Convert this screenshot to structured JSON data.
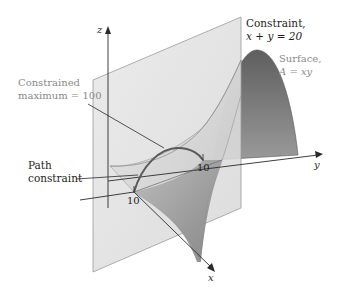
{
  "diagram": {
    "axes": {
      "z_label": "z",
      "y_label": "y",
      "x_label": "x",
      "x_tick": "10",
      "y_tick": "10"
    },
    "labels": {
      "constraint_line1": "Constraint,",
      "constraint_line2": "x + y = 20",
      "surface_line1": "Surface,",
      "surface_line2": "A = xy",
      "max_line1": "Constrained",
      "max_line2": "maximum = 100",
      "path_line1": "Path",
      "path_line2": "constraint"
    },
    "colors": {
      "plane_fill": "#e2e2e2",
      "plane_edge": "#9a9a9a",
      "surface_dark": "#6e6e6e",
      "surface_light": "#d4d4d4",
      "path_curve": "#5a5a5a",
      "axis": "#2a2a2a",
      "label_dark": "#1e1e1e",
      "label_grey": "#8a8a8a"
    }
  }
}
